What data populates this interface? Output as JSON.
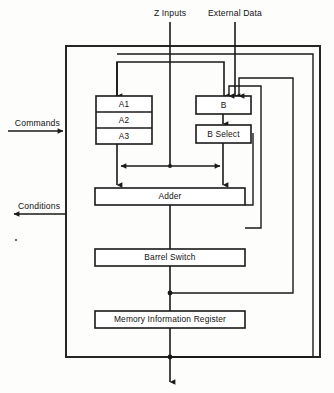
{
  "diagram": {
    "io_labels": {
      "z_inputs": "Z Inputs",
      "external_data": "External Data",
      "commands": "Commands",
      "conditions": "Conditions"
    },
    "registers": {
      "a_stack": [
        "A1",
        "A2",
        "A3"
      ],
      "b_register": "B",
      "b_select": "B Select"
    },
    "units": [
      {
        "id": "adder",
        "label": "Adder"
      },
      {
        "id": "barrel-switch",
        "label": "Barrel Switch"
      },
      {
        "id": "memory-information-register",
        "label": "Memory Information Register"
      }
    ],
    "colors": {
      "line": "#1a1a1a",
      "outer_border": "#262626",
      "box_fill": "#ffffff",
      "background": "#fdfdfc"
    }
  }
}
